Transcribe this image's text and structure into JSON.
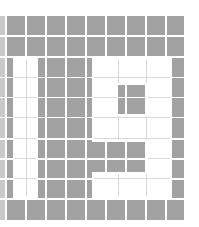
{
  "pattern": {
    "description": "Gray tile grid with white block-letter cutouts",
    "colors": {
      "tile": "#a2a2a2",
      "tile_partial": "#c9c9c9",
      "gap": "#ffffff",
      "cutout": "#ffffff",
      "cutout_seam": "#d8d8d8"
    },
    "grid": {
      "columns_x": [
        [
          0,
          5
        ],
        [
          7,
          25
        ],
        [
          27,
          45
        ],
        [
          47,
          65
        ],
        [
          67,
          85
        ],
        [
          87,
          105
        ],
        [
          107,
          125
        ],
        [
          127,
          145
        ],
        [
          147,
          165
        ],
        [
          167,
          184
        ]
      ],
      "rows_y": [
        [
          16,
          35
        ],
        [
          37,
          56
        ],
        [
          58,
          77
        ],
        [
          78,
          97
        ],
        [
          98,
          117
        ],
        [
          118,
          138
        ],
        [
          140,
          158
        ],
        [
          160,
          178
        ],
        [
          180,
          198
        ],
        [
          200,
          220
        ]
      ]
    },
    "cutouts": [
      {
        "name": "left-bar",
        "x": 13,
        "y": 58,
        "w": 25,
        "h": 140
      },
      {
        "name": "right-top-bar",
        "x": 92,
        "y": 58,
        "w": 80,
        "h": 27
      },
      {
        "name": "right-left-stem-upper",
        "x": 92,
        "y": 85,
        "w": 26,
        "h": 29
      },
      {
        "name": "right-right-stem-upper",
        "x": 146,
        "y": 85,
        "w": 26,
        "h": 29
      },
      {
        "name": "right-middle-bar",
        "x": 92,
        "y": 114,
        "w": 80,
        "h": 28
      },
      {
        "name": "right-right-stem-lower",
        "x": 146,
        "y": 142,
        "w": 26,
        "h": 30
      },
      {
        "name": "right-bottom-bar",
        "x": 92,
        "y": 172,
        "w": 80,
        "h": 26
      }
    ]
  }
}
